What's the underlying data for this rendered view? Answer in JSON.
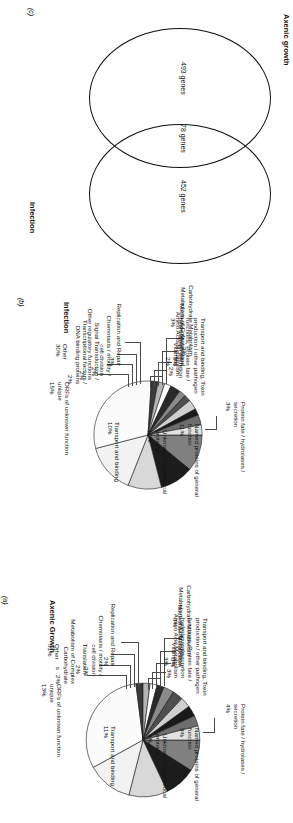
{
  "figure": {
    "orientation": "rotated-90",
    "panels": [
      "c",
      "b",
      "a"
    ]
  },
  "panel_c": {
    "tag": "(c)",
    "type": "venn",
    "left_label": "Axenic growth",
    "right_label": "Infection",
    "left_value": "493 genes",
    "overlap_value": "78 genes",
    "right_value": "452 genes"
  },
  "panel_b": {
    "tag": "(b)",
    "title": "Infection"
  },
  "panel_a": {
    "tag": "(a)",
    "title": "Axenic Growth"
  },
  "chart_data": [
    {
      "id": "panel_b",
      "type": "pie",
      "title": "Infection",
      "panel_tag": "(b)",
      "unit": "%",
      "categories": [
        "Named proteins of general function",
        "Unknown / hypothetical proteins",
        "Transport and binding",
        "ORFs of unknown function unique",
        "Other",
        "Transcriptional factors / DNA binding proteins",
        "Signal Transduction / Other regulatory functions",
        "Chemotaxis / motility / cell division",
        "Replication and Repair",
        "Carbohydrate Metabolism",
        "Metabolism of Cofactors and Vitamins",
        "Nucleotide Metabolism",
        "Amino Acid Metabolism",
        "Transport and binding, Toxin production / other pathogen functions, Protein fate / hydrolases / secretion",
        "Protein fate / hydrolases / secretion"
      ],
      "values": [
        11,
        10,
        10,
        15,
        30,
        2,
        2,
        2,
        3,
        2,
        2,
        3,
        2,
        3,
        3
      ],
      "labels": [
        "Named proteins of general\nfunction\n11%",
        "Unknown / hypothetical\nproteins\n10%",
        "Transport and binding\n10%",
        "ORFs of unknown function\nunique\n15%",
        "Other\n30%",
        "Transcriptional factors /\nDNA binding proteins\n2%",
        "Signal Transduction /\nOther regulatory functions\n2%",
        "Chemotaxis / motility /\ncell division\n2%",
        "Replication and Repair\n3%",
        "Carbohydrate Metabolism\n2%",
        "Metabolism of Cofactors and\nVitamins\n2%",
        "Nucleotide Metabolism\n3%",
        "Amino Acid Metabolism\n2%",
        "Transport and binding, Toxin\nproduction / other pathogen\nfunctions, Protein fate /\nhydrolases / secretion\n3%",
        "Protein fate / hydrolases /\nsecretion\n3%"
      ],
      "legend": "none",
      "grid": false
    },
    {
      "id": "panel_a",
      "type": "pie",
      "title": "Axenic Growth",
      "panel_tag": "(a)",
      "unit": "%",
      "categories": [
        "Named proteins of general function",
        "Unknown / hypothetical proteins",
        "Transport and binding",
        "ORFs of unknown function unique",
        "Other",
        "Metabolism of Complex Carbohydrates",
        "Translation",
        "Chemotaxis / motility / cell division",
        "Replication and Repair",
        "Carbohydrate Metabolism",
        "Metabolism of Cofactors and Vitamins",
        "Nucleotide Metabolism",
        "Amino Acid Metabolism",
        "Transport and binding, Toxin production / other pathogen functions, Protein fate / hydrolases / secretion",
        "Protein fate / hydrolases / secretion"
      ],
      "values": [
        9,
        9,
        11,
        13,
        31,
        2,
        2,
        2,
        2,
        3,
        3,
        3,
        3,
        3,
        4
      ],
      "labels": [
        "Named proteins of general\nfunction\n9%",
        "Unknown / hypothetical\nproteins\n9%",
        "Transport and binding\n11%",
        "ORFs of unknown function\nunique\n13%",
        "Other\n31%",
        "Metabolism of Complex\nCarbohydrate\ns   2%",
        "Translation\n2%",
        "Chemotaxis / motility /\ncell division\n2%",
        "Replication and Repair\n2%",
        "Carbohydrate Metabolism\n3%",
        "Metabolism of Cofactors and\nVitamins\n3%",
        "Nucleotide Metabolism\n3%",
        "Amino Acid Metabolism\n3%",
        "Transport and binding, Toxin\nproduction / other pathogen\nfunctions, Protein fate /\nhydrolases / secretion\n3%",
        "Protein fate / hydrolases /\nsecretion\n4%"
      ],
      "legend": "none",
      "grid": false
    }
  ],
  "colors": {
    "outline": "#1a1a1a",
    "leader": "#4a4a4a",
    "text": "#111111",
    "slice_palette": [
      "#808080",
      "#1c1c1c",
      "#d8d8d8",
      "#f2f2f2",
      "#fbfbfb",
      "#3a3a3a",
      "#b5b5b5",
      "#ffffff",
      "#2a2a2a",
      "#8a8a8a",
      "#4f4f4f",
      "#cfcfcf",
      "#1a1a1a",
      "#6e6e6e",
      "#e2e2e2"
    ]
  }
}
